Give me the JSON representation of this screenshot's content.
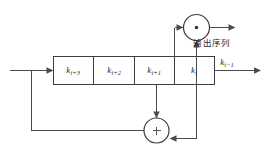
{
  "diagram": {
    "type": "feedback-shift-register",
    "register": {
      "name": "shift-register",
      "cells": [
        {
          "id": "cell-ki3",
          "base": "k",
          "subscript": "i+3",
          "label": "k"
        },
        {
          "id": "cell-ki2",
          "base": "k",
          "subscript": "i+2",
          "label": "k"
        },
        {
          "id": "cell-ki1",
          "base": "k",
          "subscript": "i+1",
          "label": "k"
        },
        {
          "id": "cell-ki",
          "base": "k",
          "subscript": "i",
          "label": "k"
        }
      ]
    },
    "gates": {
      "and_gate": {
        "name": "multiply-gate",
        "symbol": "·",
        "operation": "and"
      },
      "xor_gate": {
        "name": "xor-gate",
        "symbol": "+",
        "operation": "xor"
      }
    },
    "labels": {
      "output_sequence": "输出序列",
      "output_bit_base": "k",
      "output_bit_subscript": "i−1"
    },
    "colors": {
      "wire": "#4a4a52",
      "box_stroke": "#3d3d45",
      "gate_stroke": "#3a3a42",
      "text": "#2a2a30",
      "background": "#ffffff"
    }
  }
}
